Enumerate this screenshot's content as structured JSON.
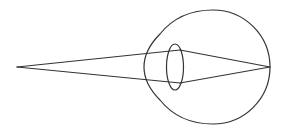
{
  "diagram": {
    "type": "eye-ray-diagram",
    "colors": {
      "background": "#ffffff",
      "stroke": "#333333"
    },
    "elements": {
      "object_point": {
        "x": 17,
        "y": 67
      },
      "eyeball": {
        "cx": 213,
        "cy": 67,
        "r": 57
      },
      "lens": {
        "cx": 175,
        "cy": 67,
        "rx": 9,
        "ry": 23
      },
      "focus_point": {
        "x": 270,
        "y": 67
      },
      "ray_top_lens_point": {
        "x": 180,
        "y": 50
      },
      "ray_bottom_lens_point": {
        "x": 180,
        "y": 83
      }
    }
  }
}
